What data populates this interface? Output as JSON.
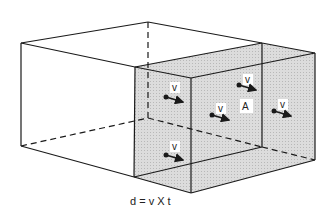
{
  "diagram": {
    "vector_label": "v",
    "area_label": "A",
    "formula": "d = v X t",
    "colors": {
      "line": "#1a1a1a",
      "shade": "#d6d6d6",
      "background": "#ffffff"
    }
  }
}
